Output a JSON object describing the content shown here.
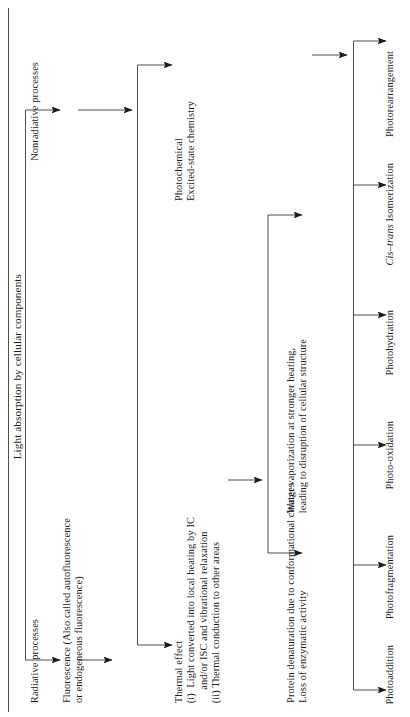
{
  "diagram": {
    "type": "flowchart",
    "orientation": "rotated-90-ccw",
    "title": "Light absorption by cellular components",
    "level1": {
      "nonradiative": "Nonradiative processes",
      "radiative": "Radiative processes"
    },
    "level2": {
      "fluorescence": "Fluorescence (Also called autofluorescence\nor endogeneous fluorescence)",
      "photochemical": "Photochemical\nExcited-state chemistry",
      "thermal": "Thermal effect\n(i)  Light converted into local heating by IC\n     and/or ISC and vibrational relaxation\n(ii) Thermal conduction to other areas"
    },
    "level3": {
      "water_vaporization": "Water vaporization at stronger heating,\nleading to disruption of cellular structure",
      "protein_denaturation": "Protein denaturation due to conformational changes\nLoss of enzymatic activity"
    },
    "outcomes": [
      {
        "label": "Photoaddition",
        "italic_prefix": ""
      },
      {
        "label": "Photofragmentation",
        "italic_prefix": ""
      },
      {
        "label": "Photo-oxidation",
        "italic_prefix": ""
      },
      {
        "label": "Photohydration",
        "italic_prefix": ""
      },
      {
        "label": "Isomerization",
        "italic_prefix": "Cis–trans"
      },
      {
        "label": "Photorearrangement",
        "italic_prefix": ""
      }
    ],
    "colors": {
      "line": "#3a3a3a",
      "text": "#1a1a1a",
      "background": "#ffffff"
    }
  }
}
